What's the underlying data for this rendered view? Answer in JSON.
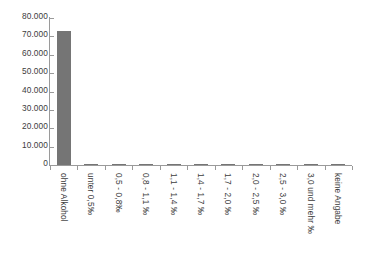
{
  "chart_data": {
    "type": "bar",
    "title": "",
    "subtitle": "",
    "xlabel": "",
    "ylabel": "",
    "categories": [
      "ohne Alkohol",
      "unter 0,5‰",
      "0,5 - 0,8‰",
      "0,8 - 1,1 ‰",
      "1,1 - 1,4 ‰",
      "1,4 - 1,7 ‰",
      "1,7 - 2,0 ‰",
      "2,0 - 2,5 ‰",
      "2,5 - 3,0 ‰",
      "3,0 und mehr ‰",
      "keine Angabe"
    ],
    "values": [
      73000,
      60,
      90,
      150,
      220,
      400,
      520,
      560,
      210,
      70,
      40
    ],
    "ylim": [
      0,
      80000
    ],
    "ytick_values": [
      0,
      10000,
      20000,
      30000,
      40000,
      50000,
      60000,
      70000,
      80000
    ],
    "ytick_labels": [
      "0",
      "10.000",
      "20.000",
      "30.000",
      "40.000",
      "50.000",
      "60.000",
      "70.000",
      "80.000"
    ],
    "grid": false,
    "legend": false,
    "legend_position": "none",
    "bar_color": "#757575",
    "axis_color": "#9a9a9a",
    "text_color": "#3c3c3c",
    "background_color": "#ffffff"
  }
}
